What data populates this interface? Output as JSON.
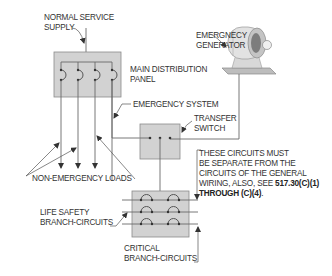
{
  "diagram": {
    "labels": {
      "normal_service_supply": [
        "NORMAL SERVICE",
        "SUPPLY"
      ],
      "emergency_generator": [
        "EMERGNECY",
        "GENERATOR"
      ],
      "main_distribution_panel": [
        "MAIN DISTRIBUTION",
        "PANEL"
      ],
      "emergency_system": "EMERGENCY SYSTEM",
      "transfer_switch": [
        "TRANSFER",
        "SWITCH"
      ],
      "non_emergency_loads": "NON-EMERGENCY LOADS",
      "life_safety": [
        "LIFE SAFETY",
        "BRANCH-CIRCUITS"
      ],
      "critical": [
        "CRITICAL",
        "BRANCH-CIRCUITS"
      ],
      "note": {
        "lines": [
          "THESE CIRCUITS MUST",
          "BE SEPARATE FROM THE",
          "CIRCUITS OF THE GENERAL",
          "WIRING, ALSO, SEE "
        ],
        "ref_a": "517.30(C)(1)",
        "ref_b": "THROUGH (C)(4)",
        "tail": "."
      }
    },
    "colors": {
      "panel_fill": "#d2d2d2",
      "line": "#6a6a6a",
      "text": "#333333"
    }
  }
}
